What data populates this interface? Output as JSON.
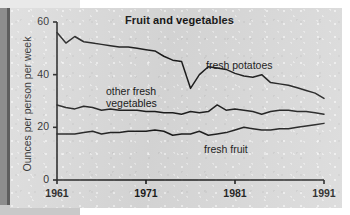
{
  "figure": {
    "title": "Fruit and vegetables",
    "y_axis_label": "Ounces per person per week",
    "y_ticks": [
      "0",
      "20",
      "40",
      "60"
    ],
    "x_ticks": [
      "1961",
      "1971",
      "1981",
      "1991"
    ],
    "annotations": {
      "potatoes": "fresh potatoes",
      "vegetables_line1": "other fresh",
      "vegetables_line2": "vegetables",
      "fruit": "fresh fruit"
    },
    "colors": {
      "background": "#d9d9d9",
      "line": "#1a1a1a",
      "axis": "#1a1a1a",
      "text": "#141414"
    }
  },
  "chart_data": {
    "type": "line",
    "title": "Fruit and vegetables",
    "xlabel": "",
    "ylabel": "Ounces per person per week",
    "xlim": [
      1961,
      1991
    ],
    "ylim": [
      0,
      60
    ],
    "yticks": [
      0,
      20,
      40,
      60
    ],
    "xticks": [
      1961,
      1971,
      1981,
      1991
    ],
    "grid": false,
    "legend": "inline-annotations",
    "x": [
      1961,
      1962,
      1963,
      1964,
      1965,
      1966,
      1967,
      1968,
      1969,
      1970,
      1971,
      1972,
      1973,
      1974,
      1975,
      1976,
      1977,
      1978,
      1979,
      1980,
      1981,
      1982,
      1983,
      1984,
      1985,
      1986,
      1987,
      1988,
      1989,
      1990,
      1991
    ],
    "series": [
      {
        "name": "fresh potatoes",
        "label": "fresh potatoes",
        "values": [
          56.0,
          52.0,
          54.5,
          52.5,
          52.0,
          51.5,
          51.0,
          50.5,
          50.5,
          50.0,
          49.5,
          49.0,
          47.0,
          45.5,
          45.0,
          34.8,
          40.0,
          43.0,
          42.5,
          42.0,
          40.5,
          39.5,
          39.0,
          40.0,
          37.0,
          36.5,
          36.0,
          35.0,
          34.0,
          33.0,
          31.0
        ]
      },
      {
        "name": "other fresh vegetables",
        "label": "other fresh vegetables",
        "values": [
          28.5,
          27.5,
          27.0,
          28.0,
          27.5,
          26.5,
          27.0,
          26.5,
          26.5,
          26.5,
          26.0,
          26.0,
          25.5,
          25.5,
          25.0,
          26.0,
          25.5,
          26.0,
          28.5,
          26.5,
          27.0,
          26.5,
          26.0,
          25.0,
          26.0,
          26.5,
          26.5,
          26.0,
          26.0,
          25.5,
          25.0
        ]
      },
      {
        "name": "fresh fruit",
        "label": "fresh fruit",
        "values": [
          17.5,
          17.5,
          17.5,
          18.0,
          18.5,
          17.5,
          18.0,
          18.0,
          18.5,
          18.5,
          18.5,
          19.0,
          18.5,
          17.0,
          17.5,
          17.5,
          18.5,
          17.0,
          17.5,
          18.0,
          19.0,
          20.0,
          19.5,
          19.0,
          19.0,
          19.5,
          19.5,
          20.0,
          20.5,
          21.0,
          21.5
        ]
      }
    ]
  }
}
